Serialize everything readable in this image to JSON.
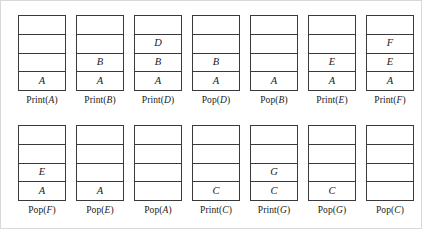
{
  "figure": {
    "stack_capacity": 4,
    "rows": [
      {
        "name": "top-row",
        "steps": [
          {
            "operation": "Print",
            "argument": "A",
            "label_prefix": "Print(",
            "label_suffix": ")",
            "cells": [
              "",
              "",
              "",
              "A"
            ]
          },
          {
            "operation": "Print",
            "argument": "B",
            "label_prefix": "Print(",
            "label_suffix": ")",
            "cells": [
              "",
              "",
              "B",
              "A"
            ]
          },
          {
            "operation": "Print",
            "argument": "D",
            "label_prefix": "Print(",
            "label_suffix": ")",
            "cells": [
              "",
              "D",
              "B",
              "A"
            ]
          },
          {
            "operation": "Pop",
            "argument": "D",
            "label_prefix": "Pop(",
            "label_suffix": ")",
            "cells": [
              "",
              "",
              "B",
              "A"
            ]
          },
          {
            "operation": "Pop",
            "argument": "B",
            "label_prefix": "Pop(",
            "label_suffix": ")",
            "cells": [
              "",
              "",
              "",
              "A"
            ]
          },
          {
            "operation": "Print",
            "argument": "E",
            "label_prefix": "Print(",
            "label_suffix": ")",
            "cells": [
              "",
              "",
              "E",
              "A"
            ]
          },
          {
            "operation": "Print",
            "argument": "F",
            "label_prefix": "Print(",
            "label_suffix": ")",
            "cells": [
              "",
              "F",
              "E",
              "A"
            ]
          }
        ]
      },
      {
        "name": "bottom-row",
        "steps": [
          {
            "operation": "Pop",
            "argument": "F",
            "label_prefix": "Pop(",
            "label_suffix": ")",
            "cells": [
              "",
              "",
              "E",
              "A"
            ]
          },
          {
            "operation": "Pop",
            "argument": "E",
            "label_prefix": "Pop(",
            "label_suffix": ")",
            "cells": [
              "",
              "",
              "",
              "A"
            ]
          },
          {
            "operation": "Pop",
            "argument": "A",
            "label_prefix": "Pop(",
            "label_suffix": ")",
            "cells": [
              "",
              "",
              "",
              ""
            ]
          },
          {
            "operation": "Print",
            "argument": "C",
            "label_prefix": "Print(",
            "label_suffix": ")",
            "cells": [
              "",
              "",
              "",
              "C"
            ]
          },
          {
            "operation": "Print",
            "argument": "G",
            "label_prefix": "Print(",
            "label_suffix": ")",
            "cells": [
              "",
              "",
              "G",
              "C"
            ]
          },
          {
            "operation": "Pop",
            "argument": "G",
            "label_prefix": "Pop(",
            "label_suffix": ")",
            "cells": [
              "",
              "",
              "",
              "C"
            ]
          },
          {
            "operation": "Pop",
            "argument": "C",
            "label_prefix": "Pop(",
            "label_suffix": ")",
            "cells": [
              "",
              "",
              "",
              ""
            ]
          }
        ]
      }
    ]
  },
  "colors": {
    "cell_border": "#3a3a3a",
    "figure_border": "#d8d8d8",
    "background": "#ffffff",
    "text": "#1a1a1a"
  }
}
